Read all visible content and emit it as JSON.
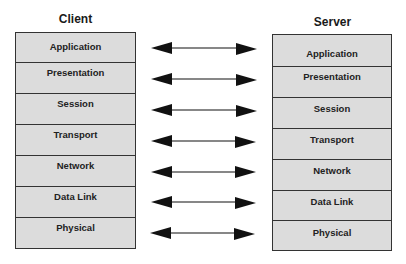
{
  "client": {
    "title": "Client",
    "layers": [
      "Application",
      "Presentation",
      "Session",
      "Transport",
      "Network",
      "Data Link",
      "Physical"
    ]
  },
  "server": {
    "title": "Server",
    "layers": [
      "Application",
      "Presentation",
      "Session",
      "Transport",
      "Network",
      "Data Link",
      "Physical"
    ]
  },
  "connections": {
    "type": "bidirectional-arrow",
    "count": 7
  },
  "colors": {
    "layer_fill": "#dcdcdc",
    "border": "#333333",
    "arrow": "#111111"
  }
}
